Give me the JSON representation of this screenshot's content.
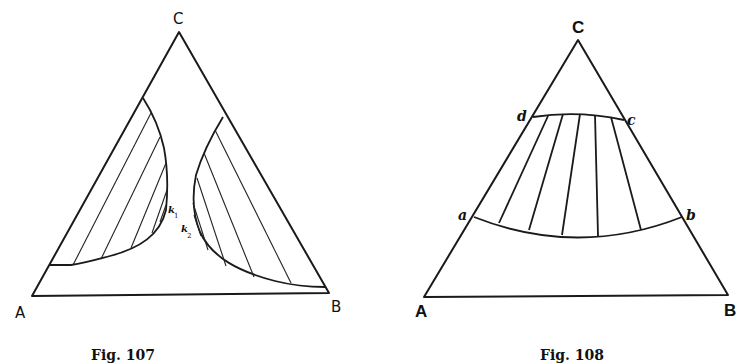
{
  "figures": [
    {
      "id": "fig107",
      "caption": "Fig. 107",
      "vertices": {
        "top": "C",
        "left": "A",
        "right": "B"
      },
      "points": [
        {
          "label": "k",
          "subscript": "1"
        },
        {
          "label": "k",
          "subscript": "2"
        }
      ],
      "description": "Ternary diagram with two separate two-phase regions (binodal curves) adjacent to sides AC and BC, each containing tie-lines, with plait points k1 and k2"
    },
    {
      "id": "fig108",
      "caption": "Fig. 108",
      "vertices": {
        "top": "C",
        "left": "A",
        "right": "B"
      },
      "points": [
        {
          "label": "a"
        },
        {
          "label": "b"
        },
        {
          "label": "c"
        },
        {
          "label": "d"
        }
      ],
      "description": "Ternary diagram with a band-shaped two-phase region abcd spanning from side AC to side BC, with tie-lines connecting curve dc to curve ab"
    }
  ]
}
